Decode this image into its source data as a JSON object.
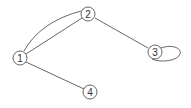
{
  "diagram": {
    "type": "undirected multigraph",
    "colors": {
      "stroke": "#555555",
      "node_fill": "#ffffff",
      "label": "#333333"
    },
    "nodes": [
      {
        "id": "1",
        "label": "1",
        "x": 20,
        "y": 58
      },
      {
        "id": "2",
        "label": "2",
        "x": 88,
        "y": 14
      },
      {
        "id": "3",
        "label": "3",
        "x": 155,
        "y": 52
      },
      {
        "id": "4",
        "label": "4",
        "x": 90,
        "y": 92
      }
    ],
    "edges": [
      {
        "from": "1",
        "to": "2",
        "kind": "straight"
      },
      {
        "from": "1",
        "to": "2",
        "kind": "curved"
      },
      {
        "from": "2",
        "to": "3",
        "kind": "straight"
      },
      {
        "from": "3",
        "to": "3",
        "kind": "self-loop"
      },
      {
        "from": "1",
        "to": "4",
        "kind": "straight"
      }
    ]
  }
}
